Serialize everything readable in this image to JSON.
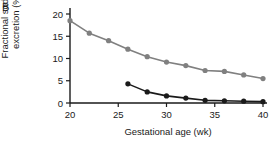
{
  "panel": {
    "label": "B"
  },
  "chart_data": {
    "type": "line",
    "title": "",
    "subtitle": "",
    "xlabel": "Gestational age (wk)",
    "ylabel": "Fractional sodium excretion (%)",
    "xlim": [
      20,
      40
    ],
    "ylim": [
      0,
      20
    ],
    "xticks": [
      20,
      25,
      30,
      35,
      40
    ],
    "yticks": [
      0,
      5,
      10,
      15,
      20
    ],
    "xtick_labels": [
      "20",
      "25",
      "30",
      "35",
      "40"
    ],
    "ytick_labels": [
      "0",
      "5",
      "10",
      "15",
      "20"
    ],
    "grid": false,
    "legend": "none",
    "colors": {
      "series_gray": "#808080",
      "series_dark": "#1a1a1a",
      "axis": "#1a1a1a"
    },
    "series": [
      {
        "name": "gray-series",
        "color": "#808080",
        "marker": "circle",
        "x": [
          20,
          22,
          24,
          26,
          28,
          30,
          32,
          34,
          36,
          38,
          40
        ],
        "values": [
          18.5,
          15.7,
          14.0,
          12.1,
          10.4,
          9.2,
          8.4,
          7.3,
          7.1,
          6.3,
          5.5
        ]
      },
      {
        "name": "dark-series",
        "color": "#1a1a1a",
        "marker": "circle",
        "x": [
          26,
          28,
          30,
          32,
          34,
          36,
          38,
          40
        ],
        "values": [
          4.3,
          2.5,
          1.6,
          1.1,
          0.6,
          0.5,
          0.4,
          0.3
        ]
      }
    ]
  }
}
